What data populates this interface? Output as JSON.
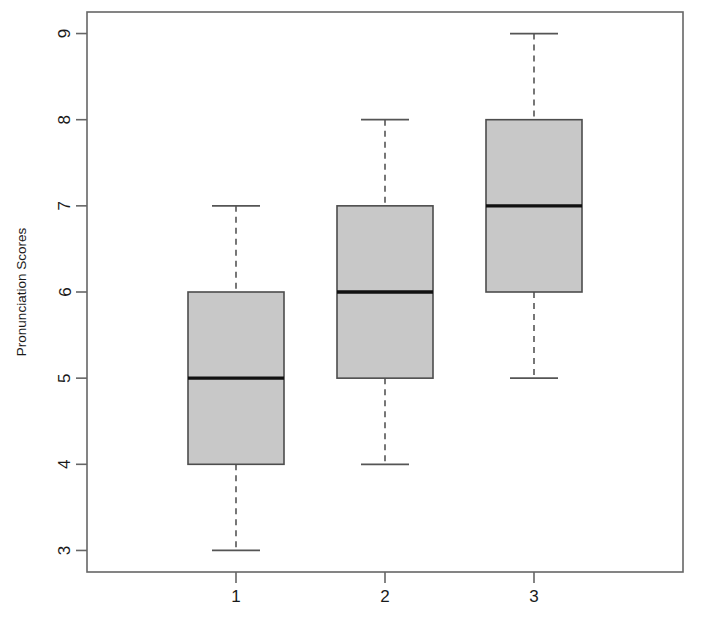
{
  "chart_data": {
    "type": "boxplot",
    "title": "",
    "subtitle": "",
    "xlabel": "",
    "ylabel": "Pronunciation Scores",
    "categories": [
      "1",
      "2",
      "3"
    ],
    "xtick_labels": [
      "1",
      "2",
      "3"
    ],
    "ytick_labels": [
      "3",
      "4",
      "5",
      "6",
      "7",
      "8",
      "9"
    ],
    "ytick_values": [
      3,
      4,
      5,
      6,
      7,
      8,
      9
    ],
    "ylim": [
      2.75,
      9.25
    ],
    "grid": false,
    "legend": null,
    "box_fill_color": "#c8c8c8",
    "box_border_color": "#4d4d4d",
    "median_color": "#111111",
    "whisker_color": "#555555",
    "frame_color": "#666666",
    "background_color": "#ffffff",
    "boxes": [
      {
        "label": "1",
        "lower_whisker": 3,
        "q1": 4,
        "median": 5,
        "q3": 6,
        "upper_whisker": 7,
        "outliers": []
      },
      {
        "label": "2",
        "lower_whisker": 4,
        "q1": 5,
        "median": 6,
        "q3": 7,
        "upper_whisker": 8,
        "outliers": []
      },
      {
        "label": "3",
        "lower_whisker": 5,
        "q1": 6,
        "median": 7,
        "q3": 8,
        "upper_whisker": 9,
        "outliers": []
      }
    ]
  }
}
